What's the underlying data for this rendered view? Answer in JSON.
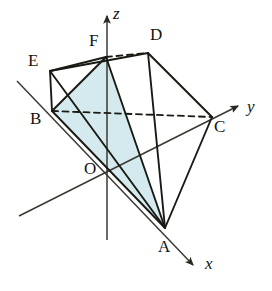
{
  "figure": {
    "width": 272,
    "height": 291,
    "background_color": "#ffffff",
    "stroke_color": "#1a1a14",
    "shade_fill_color": "#d5eaee",
    "axis_color": "#3a3a34"
  },
  "axes": [
    {
      "name": "x",
      "label": "x",
      "label_x": 205,
      "label_y": 255,
      "arrow_tip_x": 196,
      "arrow_tip_y": 268,
      "origin_x": 108,
      "origin_y": 172
    },
    {
      "name": "y",
      "label": "y",
      "label_x": 247,
      "label_y": 98,
      "arrow_tip_x": 241,
      "arrow_tip_y": 104,
      "origin_x": 108,
      "origin_y": 172
    },
    {
      "name": "z",
      "label": "z",
      "label_x": 113,
      "label_y": 5,
      "arrow_tip_x": 107,
      "arrow_tip_y": 12,
      "origin_x": 108,
      "origin_y": 172
    }
  ],
  "vertices": [
    {
      "name": "O",
      "label": "O",
      "x": 108,
      "y": 172,
      "label_x": 84,
      "label_y": 160
    },
    {
      "name": "A",
      "label": "A",
      "x": 165,
      "y": 228,
      "label_x": 158,
      "label_y": 238
    },
    {
      "name": "B",
      "label": "B",
      "x": 52,
      "y": 111,
      "label_x": 30,
      "label_y": 110
    },
    {
      "name": "C",
      "label": "C",
      "x": 212,
      "y": 117,
      "label_x": 214,
      "label_y": 118
    },
    {
      "name": "D",
      "label": "D",
      "x": 148,
      "y": 53,
      "label_x": 150,
      "label_y": 26
    },
    {
      "name": "E",
      "label": "E",
      "x": 50,
      "y": 71,
      "label_x": 28,
      "label_y": 52
    },
    {
      "name": "F",
      "label": "F",
      "x": 106,
      "y": 57,
      "label_x": 89,
      "label_y": 32
    }
  ],
  "edges": [
    {
      "name": "edge-E-F",
      "from": "E",
      "to": "F",
      "style": "solid"
    },
    {
      "name": "edge-F-D",
      "from": "F",
      "to": "D",
      "style": "dashed"
    },
    {
      "name": "edge-E-D",
      "from": "E",
      "to": "D",
      "style": "solid"
    },
    {
      "name": "edge-E-B",
      "from": "E",
      "to": "B",
      "style": "solid"
    },
    {
      "name": "edge-B-F",
      "from": "B",
      "to": "F",
      "style": "solid"
    },
    {
      "name": "edge-B-C",
      "from": "B",
      "to": "C",
      "style": "dashed"
    },
    {
      "name": "edge-D-C",
      "from": "D",
      "to": "C",
      "style": "solid"
    },
    {
      "name": "edge-D-A",
      "from": "D",
      "to": "A",
      "style": "solid"
    },
    {
      "name": "edge-C-A",
      "from": "C",
      "to": "A",
      "style": "solid"
    },
    {
      "name": "edge-F-A",
      "from": "F",
      "to": "A",
      "style": "solid"
    },
    {
      "name": "edge-B-A",
      "from": "B",
      "to": "A",
      "style": "solid"
    },
    {
      "name": "edge-E-A",
      "from": "E",
      "to": "A",
      "style": "solid"
    }
  ],
  "shaded_region": {
    "name": "shaded-quadrilateral-BFA",
    "vertices": [
      "B",
      "F",
      "A"
    ],
    "fill": "#d5eaee",
    "description": "Light blue shaded cross-section through B, F and A"
  }
}
